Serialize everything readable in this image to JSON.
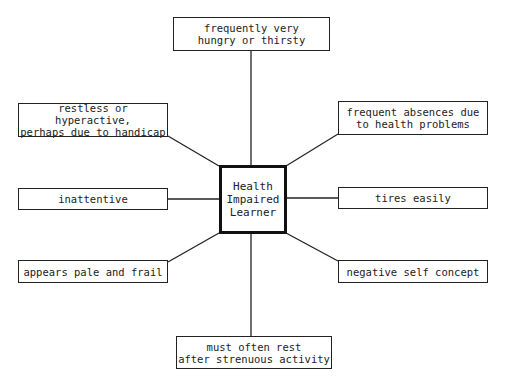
{
  "diagram": {
    "center": {
      "label": "Health\nImpaired\nLearner"
    },
    "nodes": [
      {
        "id": "top",
        "label": "frequently very\nhungry or thirsty"
      },
      {
        "id": "upper-left",
        "label": "restless or hyperactive,\nperhaps due to handicap"
      },
      {
        "id": "upper-right",
        "label": "frequent absences due\nto health problems"
      },
      {
        "id": "mid-left",
        "label": "inattentive"
      },
      {
        "id": "mid-right",
        "label": "tires easily"
      },
      {
        "id": "lower-left",
        "label": "appears pale and frail"
      },
      {
        "id": "lower-right",
        "label": "negative self concept"
      },
      {
        "id": "bottom",
        "label": "must often rest\nafter strenuous activity"
      }
    ]
  }
}
